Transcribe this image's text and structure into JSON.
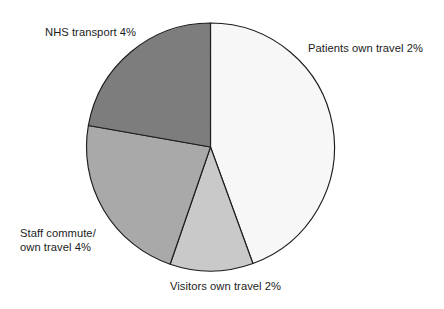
{
  "chart_data": {
    "type": "pie",
    "title": "",
    "subtitle": "",
    "xlabel": "",
    "ylabel": "",
    "legend_position": "none",
    "grid": false,
    "labels_inline": true,
    "start_angle_deg": 0,
    "direction": "clockwise",
    "categories": [
      "Patients own travel",
      "Visitors own travel",
      "Staff commute/ own travel",
      "NHS transport"
    ],
    "values": [
      2,
      2,
      4,
      4
    ],
    "value_unit": "%",
    "slices": [
      {
        "name": "Patients own travel",
        "label": "Patients own travel 2%",
        "value": 2,
        "value_text": "2%",
        "color": "#f7f7f7",
        "start_angle_deg": 0,
        "end_angle_deg": 160
      },
      {
        "name": "Visitors own travel",
        "label": "Visitors own travel 2%",
        "value": 2,
        "value_text": "2%",
        "color": "#c9c9c9",
        "start_angle_deg": 160,
        "end_angle_deg": 199
      },
      {
        "name": "Staff commute own travel",
        "label": "Staff commute/ own travel 4%",
        "label_line1": "Staff commute/",
        "label_line2": "own travel 4%",
        "value": 4,
        "value_text": "4%",
        "color": "#a9a9a9",
        "start_angle_deg": 199,
        "end_angle_deg": 280
      },
      {
        "name": "NHS transport",
        "label": "NHS transport 4%",
        "value": 4,
        "value_text": "4%",
        "color": "#7d7d7d",
        "start_angle_deg": 280,
        "end_angle_deg": 360
      }
    ]
  },
  "labels": {
    "nhs_transport": "NHS transport 4%",
    "patients_own_travel": "Patients own travel 2%",
    "staff_commute_line1": "Staff commute/",
    "staff_commute_line2": "own travel 4%",
    "visitors_own_travel": "Visitors own travel 2%"
  },
  "geometry": {
    "center_x": 210.5,
    "center_y": 147,
    "radius": 124
  },
  "colors": {
    "outline": "#1d1d1d",
    "background": "#ffffff",
    "text": "#1c1c1c"
  }
}
